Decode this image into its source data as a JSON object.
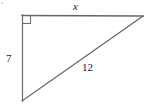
{
  "figure": {
    "type": "right-triangle-diagram",
    "background_color": "#ffffff",
    "stroke_color": "#4d4d4d",
    "top_edge_color": "#666666",
    "labels": {
      "top_side": "x",
      "vertical_side": "7",
      "hypotenuse": "12"
    },
    "right_angle_marker": {
      "present": true,
      "location": "top-left vertex",
      "size_px": 8
    },
    "vertices": {
      "top_left": {
        "x": 22,
        "y": 15
      },
      "top_right": {
        "x": 143,
        "y": 16
      },
      "bottom_left": {
        "x": 22,
        "y": 101
      }
    },
    "sides": [
      {
        "name": "top",
        "label": "x",
        "from": "top_left",
        "to": "top_right",
        "known": false
      },
      {
        "name": "vertical-leg",
        "label": "7",
        "from": "top_left",
        "to": "bottom_left",
        "known": true
      },
      {
        "name": "hypotenuse",
        "label": "12",
        "from": "bottom_left",
        "to": "top_right",
        "known": true
      }
    ]
  }
}
